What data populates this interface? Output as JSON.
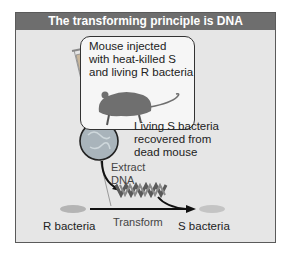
{
  "diagram": {
    "title": "The transforming principle is DNA",
    "mouse_box_lines": [
      "Mouse injected",
      "with heat-killed S",
      "and living R bacteria"
    ],
    "recovered_lines": [
      "Living S bacteria",
      "recovered from",
      "dead mouse"
    ],
    "extract_lines": [
      "Extract",
      "DNA"
    ],
    "left_label": "R bacteria",
    "arrow_label": "Transform",
    "right_label": "S bacteria",
    "colors": {
      "header_bg": "#6e6e6e",
      "panel_bg": "#e6e6e6",
      "border": "#5a5a5a",
      "arrow": "#111111",
      "dna": "#5a5a5a",
      "circle_fill": "#a9b4bb"
    }
  }
}
